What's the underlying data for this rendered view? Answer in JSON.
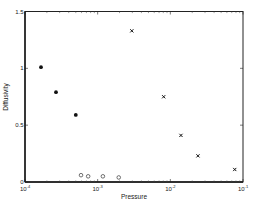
{
  "chart_data": {
    "type": "scatter",
    "title": "",
    "xlabel": "Pressure",
    "ylabel": "Diffusivity",
    "xscale": "log",
    "xlim": [
      0.0001,
      0.1
    ],
    "ylim": [
      0,
      1.5
    ],
    "grid": false,
    "legend": null,
    "x_ticks": [
      {
        "value": 0.0001,
        "base": "10",
        "exp": "-4"
      },
      {
        "value": 0.001,
        "base": "10",
        "exp": "-3"
      },
      {
        "value": 0.01,
        "base": "10",
        "exp": "-2"
      },
      {
        "value": 0.1,
        "base": "10",
        "exp": "-1"
      }
    ],
    "y_ticks": [
      {
        "value": 0,
        "label": "0"
      },
      {
        "value": 0.5,
        "label": "0.5"
      },
      {
        "value": 1,
        "label": "1"
      },
      {
        "value": 1.5,
        "label": "1.5"
      }
    ],
    "series": [
      {
        "name": "filled-dots",
        "marker": "filled-circle",
        "color": "#111111",
        "x": [
          0.000166,
          0.000267,
          0.0005
        ],
        "y": [
          1.01,
          0.79,
          0.59
        ]
      },
      {
        "name": "open-circles",
        "marker": "open-circle",
        "color": "#333333",
        "x": [
          0.00059,
          0.00074,
          0.00118,
          0.00195
        ],
        "y": [
          0.06,
          0.05,
          0.05,
          0.04
        ]
      },
      {
        "name": "x-marks",
        "marker": "x",
        "color": "#111111",
        "x": [
          0.00295,
          0.0081,
          0.014,
          0.024,
          0.077
        ],
        "y": [
          1.33,
          0.75,
          0.41,
          0.23,
          0.11
        ]
      }
    ]
  }
}
